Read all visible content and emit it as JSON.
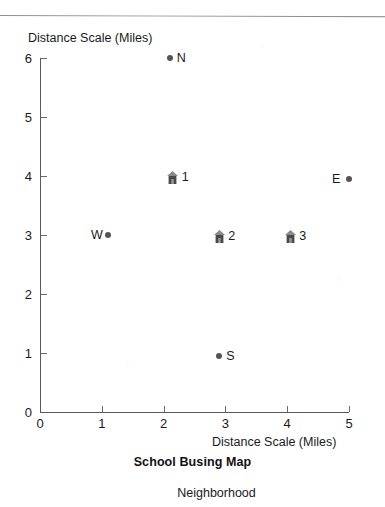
{
  "chart_data": {
    "type": "scatter",
    "title": "School Busing Map",
    "subtitle": "Neighborhood",
    "xlabel": "Distance Scale (Miles)",
    "ylabel": "Distance Scale (Miles)",
    "xlim": [
      0,
      5
    ],
    "ylim": [
      0,
      6
    ],
    "xticks": [
      "0",
      "1",
      "2",
      "3",
      "4",
      "5"
    ],
    "yticks": [
      "0",
      "1",
      "2",
      "3",
      "4",
      "5",
      "6"
    ],
    "grid": false,
    "legend": "none",
    "series": [
      {
        "name": "Compass Points",
        "marker": "dot",
        "points": [
          {
            "label": "N",
            "x": 2.1,
            "y": 6.0,
            "label_side": "right"
          },
          {
            "label": "E",
            "x": 5.0,
            "y": 3.95,
            "label_side": "left"
          },
          {
            "label": "S",
            "x": 2.9,
            "y": 0.95,
            "label_side": "right"
          },
          {
            "label": "W",
            "x": 1.1,
            "y": 3.0,
            "label_side": "left"
          }
        ]
      },
      {
        "name": "Schools",
        "marker": "house",
        "points": [
          {
            "label": "1",
            "x": 2.15,
            "y": 4.0,
            "label_side": "right"
          },
          {
            "label": "2",
            "x": 2.9,
            "y": 3.0,
            "label_side": "right"
          },
          {
            "label": "3",
            "x": 4.05,
            "y": 3.0,
            "label_side": "right"
          }
        ]
      }
    ]
  },
  "colors": {
    "marker": "#555555",
    "axis": "#5a5a5a",
    "text": "#1a1a1a",
    "rule": "#8e8e8e"
  }
}
